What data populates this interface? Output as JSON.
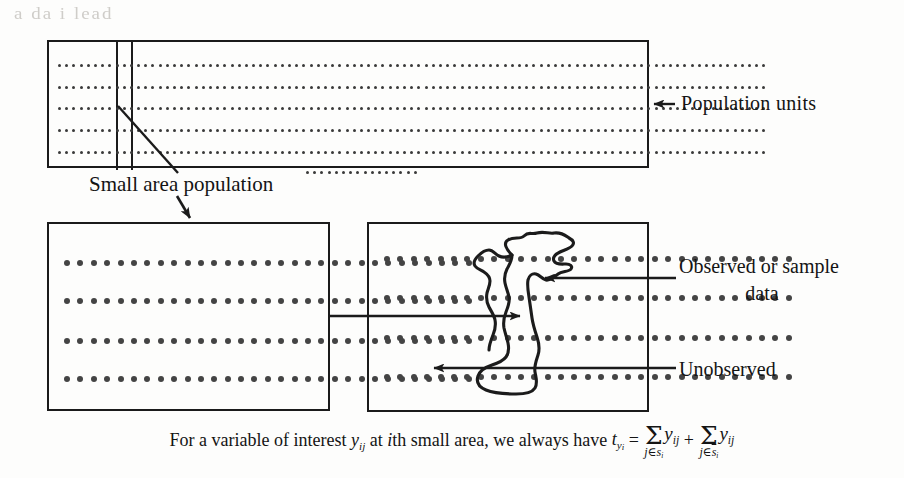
{
  "figure": {
    "type": "diagram",
    "bleed_artifact_text": "a da i  lead",
    "labels": {
      "population_units": "Population  units",
      "small_area_population": "Small area population",
      "observed_line1": "Observed or sample",
      "observed_line2": "data",
      "unobserved": "Unobserved"
    },
    "boxes": {
      "top": {
        "name": "population-box",
        "dot_rows": 5,
        "dots_per_row": 99
      },
      "lower_left": {
        "name": "small-area-box",
        "dot_rows": 4,
        "dots_per_row": 31
      },
      "lower_right": {
        "name": "sample-partition-box",
        "dot_rows": 4,
        "dots_per_row": 31
      }
    },
    "stray_dot_row": {
      "name": "stray-dots",
      "dots": 16
    },
    "formula": {
      "prefix": "For a variable of interest",
      "y_var": "y",
      "y_sub": "ij",
      "middle": "at",
      "i_italic": "i",
      "middle2": "th small area, we always have",
      "t_var": "t",
      "t_sub": "y",
      "t_subsub": "i",
      "equals": "=",
      "sigma": "Σ",
      "sum1_limit_prefix": "j∈s",
      "sum1_limit_sub": "i",
      "sum1_term": "y",
      "sum1_term_sub": "ij",
      "plus": "+",
      "sum2_limit_prefix": "j∈",
      "sum2_limit_bar": "s",
      "sum2_limit_sub": "i",
      "sum2_term": "y",
      "sum2_term_sub": "ij"
    },
    "colors": {
      "ink": "#1b1b1b",
      "dot": "#3a3a3a",
      "paper": "#fdfdfc",
      "bleed": "#cfcdc9"
    }
  }
}
